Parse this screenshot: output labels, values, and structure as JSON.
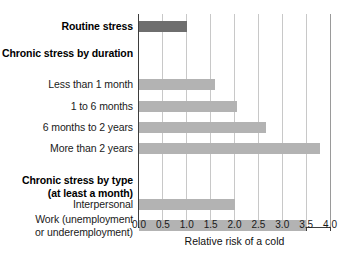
{
  "chart_data": {
    "type": "bar",
    "orientation": "horizontal",
    "title": "",
    "xlabel": "Relative risk of a cold",
    "ylabel": "",
    "xlim": [
      0.0,
      4.0
    ],
    "xticks": [
      "0.0",
      "0.5",
      "1.0",
      "1.5",
      "2.0",
      "2.5",
      "3.0",
      "3.5",
      "4.0"
    ],
    "xtick_values": [
      0.0,
      0.5,
      1.0,
      1.5,
      2.0,
      2.5,
      3.0,
      3.5,
      4.0
    ],
    "grid": "vertical gridlines at every x tick",
    "legend": "none",
    "categories": [
      "Routine stress",
      "Chronic stress by duration",
      "Less than 1 month",
      "1 to 6 months",
      "6 months to 2 years",
      "More than 2 years",
      "Chronic stress by type\n(at least a month)",
      "Interpersonal",
      "Work (unemployment\nor underemployment)"
    ],
    "rows": [
      {
        "label": "Routine stress",
        "header": true,
        "value": 1.0,
        "color": "#6e6e6e"
      },
      {
        "label": "Chronic stress by duration",
        "header": true,
        "value": null,
        "color": null
      },
      {
        "label": "Less than 1 month",
        "header": false,
        "value": 1.6,
        "color": "#b3b3b3"
      },
      {
        "label": "1 to 6 months",
        "header": false,
        "value": 2.05,
        "color": "#b3b3b3"
      },
      {
        "label": "6 months to 2 years",
        "header": false,
        "value": 2.65,
        "color": "#b3b3b3"
      },
      {
        "label": "More than 2 years",
        "header": false,
        "value": 3.8,
        "color": "#b3b3b3"
      },
      {
        "label": "Chronic stress by type\n(at least a month)",
        "header": true,
        "value": null,
        "color": null
      },
      {
        "label": "Interpersonal",
        "header": false,
        "value": 2.0,
        "color": "#b3b3b3"
      },
      {
        "label": "Work (unemployment\nor underemployment)",
        "header": false,
        "value": 3.5,
        "color": "#b3b3b3"
      }
    ],
    "values": [
      1.0,
      null,
      1.6,
      2.05,
      2.65,
      3.8,
      null,
      2.0,
      3.5
    ],
    "colors": {
      "bar_primary": "#6e6e6e",
      "bar_secondary": "#b3b3b3",
      "axis": "#3d3d3d",
      "grid": "#c8c8c8",
      "text": "#1a1a1a",
      "background": "#ffffff"
    }
  }
}
